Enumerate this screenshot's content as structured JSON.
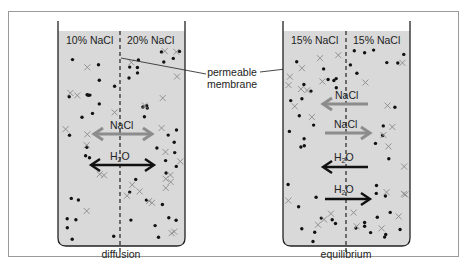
{
  "colors": {
    "frame": "#9a9a9a",
    "liquid": "#d9d9d9",
    "beaker_wall": "#222222",
    "dot": "#111111",
    "cross": "#8a8a8a",
    "nacl_arrow": "#8c8c8c",
    "water_arrow": "#111111"
  },
  "callout": {
    "line1": "permeable",
    "line2": "membrane"
  },
  "beakers": [
    {
      "id": "diffusion",
      "caption": "diffusion",
      "left_label": "10% NaCl",
      "right_label": "20% NaCl",
      "arrows": [
        {
          "label": "NaCl",
          "direction": "both",
          "kind": "nacl"
        },
        {
          "label": "H2O",
          "direction": "both",
          "kind": "water"
        }
      ]
    },
    {
      "id": "equilibrium",
      "caption": "equilibrium",
      "left_label": "15% NaCl",
      "right_label": "15% NaCl",
      "arrows": [
        {
          "label": "NaCl",
          "direction": "left",
          "kind": "nacl"
        },
        {
          "label": "NaCl",
          "direction": "right",
          "kind": "nacl"
        },
        {
          "label": "H2O",
          "direction": "left",
          "kind": "water"
        },
        {
          "label": "H2O",
          "direction": "right",
          "kind": "water"
        }
      ]
    }
  ]
}
